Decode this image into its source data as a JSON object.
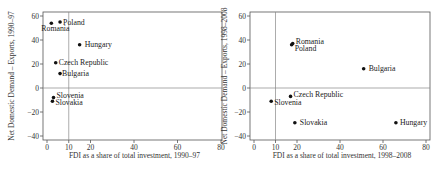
{
  "chart_data": [
    {
      "type": "scatter",
      "title": "",
      "xlabel": "FDI as a share of total investment, 1990–97",
      "ylabel": "Net Domestic Demand – Exports, 1990–97",
      "xlim": [
        0,
        80
      ],
      "ylim": [
        -40,
        60
      ],
      "xticks": [
        0,
        10,
        20,
        40,
        60,
        80
      ],
      "yticks": [
        -40,
        -20,
        0,
        20,
        40,
        60
      ],
      "reference_lines": {
        "x": 10,
        "y": 0
      },
      "grid": false,
      "points": [
        {
          "label": "Romania",
          "x": 2,
          "y": 54
        },
        {
          "label": "Poland",
          "x": 6,
          "y": 55
        },
        {
          "label": "Hungary",
          "x": 15,
          "y": 36
        },
        {
          "label": "Czech Republic",
          "x": 4,
          "y": 21
        },
        {
          "label": "Bulgaria",
          "x": 6,
          "y": 12
        },
        {
          "label": "Slovenia",
          "x": 3,
          "y": -8
        },
        {
          "label": "Slovakia",
          "x": 2.5,
          "y": -11
        }
      ]
    },
    {
      "type": "scatter",
      "title": "",
      "xlabel": "FDI as a share of total investment, 1998–2008",
      "ylabel": "Net Domestic Demand – Exports, 1998–2008",
      "xlim": [
        0,
        80
      ],
      "ylim": [
        -40,
        60
      ],
      "xticks": [
        0,
        10,
        20,
        40,
        60,
        80
      ],
      "yticks": [
        -40,
        -20,
        0,
        20,
        40,
        60
      ],
      "reference_lines": {
        "x": 10,
        "y": 0
      },
      "grid": false,
      "points": [
        {
          "label": "Romania",
          "x": 18,
          "y": 37
        },
        {
          "label": "Poland",
          "x": 17.5,
          "y": 36
        },
        {
          "label": "Bulgaria",
          "x": 51,
          "y": 16
        },
        {
          "label": "Czech Republic",
          "x": 17,
          "y": -7
        },
        {
          "label": "Slovenia",
          "x": 8,
          "y": -11
        },
        {
          "label": "Slovakia",
          "x": 19,
          "y": -29
        },
        {
          "label": "Hungary",
          "x": 66,
          "y": -29
        }
      ]
    }
  ],
  "panels": [
    {
      "xlabel": "FDI as a share of total investment, 1990–97",
      "ylabel": "Net Domestic Demand – Exports, 1990–97"
    },
    {
      "xlabel": "FDI as a share of total investment, 1998–2008",
      "ylabel": "Net Domestic Demand – Exports, 1998–2008"
    }
  ]
}
